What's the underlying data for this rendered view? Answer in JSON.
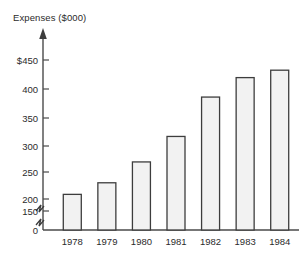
{
  "chart_data": {
    "type": "bar",
    "title": "Expenses ($000)",
    "xlabel": "",
    "ylabel": "Expenses ($000)",
    "categories": [
      "1978",
      "1979",
      "1980",
      "1981",
      "1982",
      "1983",
      "1984"
    ],
    "values": [
      160,
      185,
      230,
      285,
      370,
      412,
      428
    ],
    "series": [
      {
        "name": "Expenses",
        "values": [
          160,
          185,
          230,
          285,
          370,
          412,
          428
        ]
      }
    ],
    "ytick_labels": [
      "$450",
      "400",
      "350",
      "300",
      "250",
      "200",
      "150",
      "0"
    ],
    "ytick_values": [
      450,
      400,
      350,
      300,
      250,
      200,
      150,
      0
    ],
    "ylim": [
      150,
      450
    ],
    "axis_break": true,
    "axis_break_note": "zigzag break between 150 and 0",
    "grid": false,
    "legend": "none",
    "bar_fill_color": "#f2f2f2",
    "bar_edge_color": "#3d3d3d",
    "axis_color": "#4a4a4a",
    "text_color": "#2b2b2b"
  },
  "figure": {
    "title_text": "Expenses ($000)",
    "y_axis_arrow": "up-arrow",
    "baseline_label": "0"
  }
}
